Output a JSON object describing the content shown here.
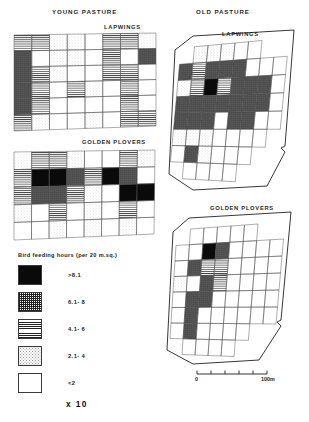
{
  "figure": {
    "panels": [
      {
        "key": "young-pasture",
        "title": "YOUNG PASTURE"
      },
      {
        "key": "old-pasture",
        "title": "OLD PASTURE"
      }
    ],
    "species": [
      {
        "key": "lapwings",
        "label": "LAPWINGS"
      },
      {
        "key": "golden-plovers",
        "label": "GOLDEN PLOVERS"
      }
    ]
  },
  "legend": {
    "title": "Bird feeding hours (per 20 m.sq.)",
    "multiplier": "x 10",
    "classes": [
      {
        "id": "c5",
        "label": ">8.1",
        "pattern": "solid-black"
      },
      {
        "id": "c4",
        "label": "6.1- 8",
        "pattern": "cross-hatch"
      },
      {
        "id": "c3",
        "label": "4.1- 6",
        "pattern": "horizontal-lines"
      },
      {
        "id": "c2",
        "label": "2.1- 4",
        "pattern": "light-stipple"
      },
      {
        "id": "c1",
        "label": "<2",
        "pattern": "blank"
      }
    ]
  },
  "scale_bar": {
    "start_label": "0",
    "end_label": "100m",
    "ticks": 5
  },
  "chart_data": {
    "type": "heatmap",
    "value_classes": [
      ">8.1",
      "6.1- 8",
      "4.1- 6",
      "2.1- 4",
      "<2"
    ],
    "class_codes": [
      5,
      4,
      3,
      2,
      1
    ],
    "legend_position": "bottom-left",
    "maps": [
      {
        "pasture": "YOUNG PASTURE",
        "species": "LAPWINGS",
        "cols": 8,
        "rows": 6,
        "grid": [
          [
            3,
            3,
            2,
            2,
            1,
            3,
            3,
            2
          ],
          [
            4,
            1,
            2,
            2,
            1,
            3,
            1,
            4
          ],
          [
            4,
            3,
            2,
            1,
            1,
            3,
            3,
            1
          ],
          [
            4,
            3,
            1,
            3,
            2,
            1,
            3,
            1
          ],
          [
            4,
            3,
            1,
            1,
            1,
            1,
            3,
            1
          ],
          [
            3,
            2,
            1,
            1,
            2,
            1,
            3,
            3
          ]
        ]
      },
      {
        "pasture": "YOUNG PASTURE",
        "species": "GOLDEN PLOVERS",
        "cols": 8,
        "rows": 5,
        "grid": [
          [
            2,
            3,
            3,
            2,
            1,
            1,
            3,
            2
          ],
          [
            3,
            5,
            5,
            4,
            3,
            5,
            4,
            1
          ],
          [
            3,
            4,
            4,
            3,
            2,
            1,
            5,
            5
          ],
          [
            2,
            1,
            3,
            1,
            2,
            1,
            3,
            1
          ],
          [
            1,
            1,
            2,
            1,
            2,
            1,
            2,
            1
          ]
        ]
      },
      {
        "pasture": "OLD PASTURE",
        "species": "LAPWINGS",
        "cols": 8,
        "rows": 8,
        "grid": [
          [
            2,
            2,
            2,
            2,
            1,
            1,
            1,
            1
          ],
          [
            4,
            3,
            4,
            4,
            4,
            1,
            1,
            1
          ],
          [
            2,
            3,
            5,
            3,
            4,
            4,
            4,
            1
          ],
          [
            4,
            4,
            4,
            4,
            4,
            4,
            4,
            1
          ],
          [
            4,
            4,
            4,
            1,
            4,
            4,
            1,
            1
          ],
          [
            2,
            2,
            2,
            1,
            1,
            1,
            1,
            1
          ],
          [
            1,
            4,
            2,
            1,
            1,
            1,
            1,
            1
          ],
          [
            1,
            1,
            1,
            1,
            1,
            1,
            1,
            1
          ]
        ]
      },
      {
        "pasture": "OLD PASTURE",
        "species": "GOLDEN PLOVERS",
        "cols": 8,
        "rows": 8,
        "grid": [
          [
            1,
            1,
            1,
            1,
            1,
            1,
            1,
            1
          ],
          [
            1,
            1,
            5,
            4,
            1,
            1,
            1,
            1
          ],
          [
            1,
            4,
            3,
            3,
            1,
            1,
            1,
            1
          ],
          [
            2,
            1,
            4,
            3,
            1,
            1,
            1,
            1
          ],
          [
            1,
            4,
            4,
            1,
            1,
            1,
            1,
            1
          ],
          [
            1,
            4,
            1,
            1,
            1,
            1,
            1,
            1
          ],
          [
            1,
            4,
            1,
            1,
            1,
            1,
            1,
            1
          ],
          [
            1,
            1,
            1,
            1,
            1,
            1,
            1,
            1
          ]
        ]
      }
    ]
  }
}
